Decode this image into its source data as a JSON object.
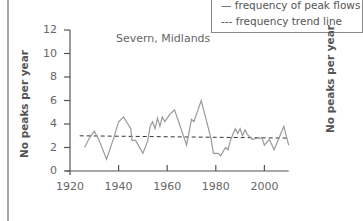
{
  "legend": {
    "items": [
      {
        "symbol": "—",
        "label": "frequency of peak flows"
      },
      {
        "symbol": "---",
        "label": "frequency trend line"
      }
    ]
  },
  "chart_data": {
    "type": "line",
    "title": "Severn, Midlands",
    "xlabel": "",
    "ylabel": "No peaks per year",
    "xlim": [
      1920,
      2010
    ],
    "ylim": [
      0,
      12
    ],
    "xticks": [
      1920,
      1940,
      1960,
      1980,
      2000
    ],
    "yticks": [
      0,
      2,
      4,
      6,
      8,
      10,
      12
    ],
    "grid": false,
    "legend_position": "top-right",
    "series": [
      {
        "name": "frequency of peak flows",
        "style": "solid",
        "color": "#9a9a9a",
        "x": [
          1926,
          1928,
          1930,
          1932,
          1935,
          1938,
          1940,
          1942,
          1945,
          1945.5,
          1947,
          1950,
          1952,
          1953,
          1954,
          1955,
          1956,
          1957,
          1958,
          1959,
          1961,
          1963,
          1965,
          1967,
          1968,
          1970,
          1971,
          1974,
          1976,
          1978,
          1979,
          1981,
          1982,
          1984,
          1985,
          1986,
          1988,
          1989,
          1990,
          1991,
          1992,
          1993,
          1995,
          1997,
          1999,
          2000,
          2002,
          2004,
          2006,
          2008,
          2010
        ],
        "values": [
          2.0,
          2.8,
          3.4,
          2.6,
          1.0,
          2.8,
          4.2,
          4.6,
          3.6,
          2.6,
          2.6,
          1.5,
          2.6,
          3.8,
          4.2,
          3.6,
          4.5,
          3.8,
          4.6,
          4.2,
          4.8,
          5.2,
          4.0,
          2.8,
          2.2,
          4.4,
          4.2,
          6.0,
          4.4,
          2.8,
          1.5,
          1.5,
          1.3,
          2.0,
          1.8,
          2.6,
          3.6,
          3.2,
          3.6,
          3.0,
          3.5,
          3.1,
          2.7,
          2.8,
          2.8,
          2.2,
          2.7,
          1.8,
          2.8,
          3.8,
          2.2
        ]
      },
      {
        "name": "frequency trend line",
        "style": "dashed",
        "color": "#333333",
        "x": [
          1924,
          2010
        ],
        "values": [
          3.0,
          2.8
        ]
      }
    ]
  },
  "right_panel": {
    "ylabel": "No peaks per year"
  }
}
